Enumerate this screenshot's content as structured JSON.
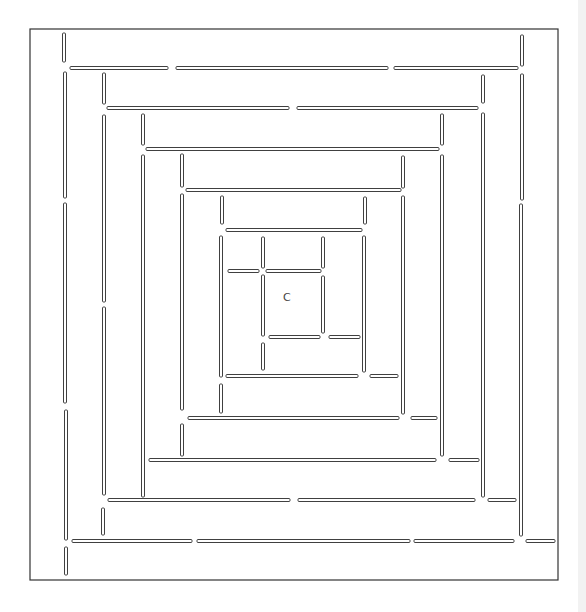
{
  "figure": {
    "type": "concentric-square maze",
    "center_label": "C",
    "center_label_pos": {
      "x": 287,
      "y": 298
    },
    "frame": {
      "x": 30,
      "y": 29,
      "width": 528,
      "height": 551
    },
    "wall_thickness": 3,
    "colors": {
      "line": "#2a2a2a",
      "background": "#ffffff"
    },
    "walls": {
      "vertical": [
        {
          "x": 64,
          "y1": 33,
          "y2": 62
        },
        {
          "x": 65,
          "y1": 72,
          "y2": 198
        },
        {
          "x": 65,
          "y1": 203,
          "y2": 403
        },
        {
          "x": 66,
          "y1": 410,
          "y2": 540
        },
        {
          "x": 66,
          "y1": 547,
          "y2": 575
        },
        {
          "x": 104,
          "y1": 73,
          "y2": 104
        },
        {
          "x": 104,
          "y1": 115,
          "y2": 302
        },
        {
          "x": 104,
          "y1": 307,
          "y2": 495
        },
        {
          "x": 103,
          "y1": 508,
          "y2": 535
        },
        {
          "x": 143,
          "y1": 114,
          "y2": 145
        },
        {
          "x": 143,
          "y1": 155,
          "y2": 497
        },
        {
          "x": 182,
          "y1": 154,
          "y2": 187
        },
        {
          "x": 182,
          "y1": 194,
          "y2": 410
        },
        {
          "x": 182,
          "y1": 424,
          "y2": 456
        },
        {
          "x": 222,
          "y1": 196,
          "y2": 224
        },
        {
          "x": 221,
          "y1": 236,
          "y2": 377
        },
        {
          "x": 221,
          "y1": 384,
          "y2": 413
        },
        {
          "x": 263,
          "y1": 237,
          "y2": 268
        },
        {
          "x": 263,
          "y1": 275,
          "y2": 336
        },
        {
          "x": 263,
          "y1": 343,
          "y2": 370
        },
        {
          "x": 323,
          "y1": 237,
          "y2": 268
        },
        {
          "x": 323,
          "y1": 276,
          "y2": 333
        },
        {
          "x": 365,
          "y1": 197,
          "y2": 224
        },
        {
          "x": 364,
          "y1": 236,
          "y2": 372
        },
        {
          "x": 403,
          "y1": 156,
          "y2": 188
        },
        {
          "x": 403,
          "y1": 196,
          "y2": 414
        },
        {
          "x": 442,
          "y1": 114,
          "y2": 145
        },
        {
          "x": 442,
          "y1": 155,
          "y2": 456
        },
        {
          "x": 483,
          "y1": 75,
          "y2": 103
        },
        {
          "x": 483,
          "y1": 113,
          "y2": 497
        },
        {
          "x": 522,
          "y1": 35,
          "y2": 66
        },
        {
          "x": 522,
          "y1": 74,
          "y2": 200
        },
        {
          "x": 521,
          "y1": 204,
          "y2": 536
        }
      ],
      "horizontal": [
        {
          "y": 68,
          "x1": 70,
          "x2": 168
        },
        {
          "y": 68,
          "x1": 176,
          "x2": 388
        },
        {
          "y": 68,
          "x1": 394,
          "x2": 518
        },
        {
          "y": 108,
          "x1": 107,
          "x2": 289
        },
        {
          "y": 108,
          "x1": 297,
          "x2": 478
        },
        {
          "y": 149,
          "x1": 146,
          "x2": 439
        },
        {
          "y": 190,
          "x1": 186,
          "x2": 401
        },
        {
          "y": 230,
          "x1": 226,
          "x2": 362
        },
        {
          "y": 271,
          "x1": 228,
          "x2": 259
        },
        {
          "y": 271,
          "x1": 266,
          "x2": 321
        },
        {
          "y": 337,
          "x1": 269,
          "x2": 320
        },
        {
          "y": 337,
          "x1": 329,
          "x2": 360
        },
        {
          "y": 376,
          "x1": 226,
          "x2": 358
        },
        {
          "y": 376,
          "x1": 370,
          "x2": 398
        },
        {
          "y": 418,
          "x1": 188,
          "x2": 399
        },
        {
          "y": 418,
          "x1": 411,
          "x2": 437
        },
        {
          "y": 460,
          "x1": 149,
          "x2": 436
        },
        {
          "y": 460,
          "x1": 449,
          "x2": 479
        },
        {
          "y": 500,
          "x1": 108,
          "x2": 290
        },
        {
          "y": 500,
          "x1": 298,
          "x2": 475
        },
        {
          "y": 500,
          "x1": 488,
          "x2": 516
        },
        {
          "y": 541,
          "x1": 72,
          "x2": 192
        },
        {
          "y": 541,
          "x1": 197,
          "x2": 410
        },
        {
          "y": 541,
          "x1": 414,
          "x2": 514
        },
        {
          "y": 541,
          "x1": 526,
          "x2": 555
        }
      ]
    }
  }
}
